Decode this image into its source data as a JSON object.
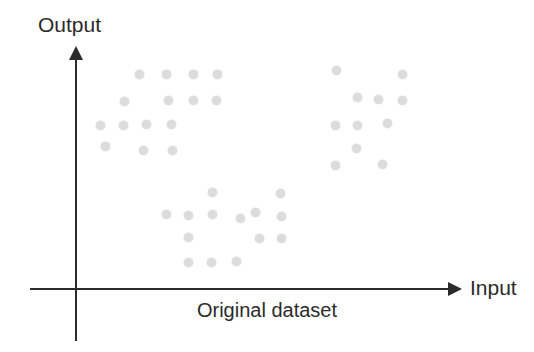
{
  "figure": {
    "caption": "Original dataset",
    "background_color": "#ffffff",
    "axis_color": "#2b2b2b",
    "point_color": "#dcdcdc"
  },
  "axes": {
    "y_label": "Output",
    "x_label": "Input",
    "y_arrow_icon": "arrow-up-icon",
    "x_arrow_icon": "arrow-right-icon"
  },
  "chart_data": {
    "type": "scatter",
    "title": "Original dataset",
    "xlabel": "Input",
    "ylabel": "Output",
    "grid": false,
    "legend": null,
    "axis_ticks": [],
    "axis_tick_labels": [],
    "xlim": [
      0,
      1
    ],
    "ylim": [
      0,
      1
    ],
    "note": "Unlabelled schematic axes; point coordinates are given in figure pixel space (origin at axis crossing x=75, y=288, y increases upward).",
    "clusters": [
      {
        "name": "upper-left-cluster",
        "count": 15,
        "points": [
          [
            139,
            74
          ],
          [
            166,
            74
          ],
          [
            193,
            74
          ],
          [
            217,
            74
          ],
          [
            124,
            101
          ],
          [
            168,
            100
          ],
          [
            193,
            100
          ],
          [
            216,
            100
          ],
          [
            100,
            125
          ],
          [
            123,
            125
          ],
          [
            146,
            124
          ],
          [
            171,
            124
          ],
          [
            105,
            146
          ],
          [
            143,
            150
          ],
          [
            172,
            150
          ]
        ]
      },
      {
        "name": "upper-right-cluster",
        "count": 11,
        "points": [
          [
            336,
            70
          ],
          [
            402,
            74
          ],
          [
            357,
            97
          ],
          [
            378,
            99
          ],
          [
            402,
            100
          ],
          [
            335,
            125
          ],
          [
            357,
            125
          ],
          [
            387,
            123
          ],
          [
            356,
            148
          ],
          [
            335,
            165
          ],
          [
            382,
            164
          ]
        ]
      },
      {
        "name": "lower-middle-cluster",
        "count": 14,
        "points": [
          [
            212,
            192
          ],
          [
            280,
            193
          ],
          [
            166,
            214
          ],
          [
            188,
            215
          ],
          [
            212,
            214
          ],
          [
            255,
            212
          ],
          [
            240,
            218
          ],
          [
            281,
            216
          ],
          [
            188,
            237
          ],
          [
            259,
            238
          ],
          [
            281,
            238
          ],
          [
            188,
            262
          ],
          [
            211,
            262
          ],
          [
            236,
            261
          ]
        ]
      }
    ],
    "total_points": 40
  }
}
